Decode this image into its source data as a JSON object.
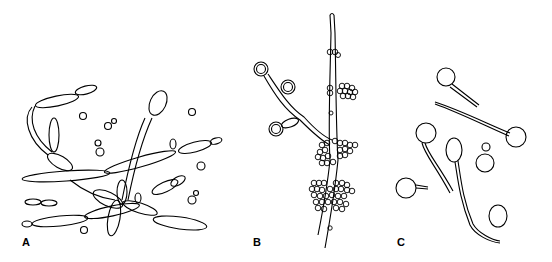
{
  "figure": {
    "panels": [
      {
        "id": "A",
        "label": "A",
        "subject": "pseudohyphae with budding yeast cells"
      },
      {
        "id": "B",
        "label": "B",
        "subject": "hypha with clustered blastoconidia and chlamydospores"
      },
      {
        "id": "C",
        "label": "C",
        "subject": "yeast cells with germ tubes"
      }
    ],
    "stroke_color": "#000000",
    "background": "#ffffff"
  }
}
